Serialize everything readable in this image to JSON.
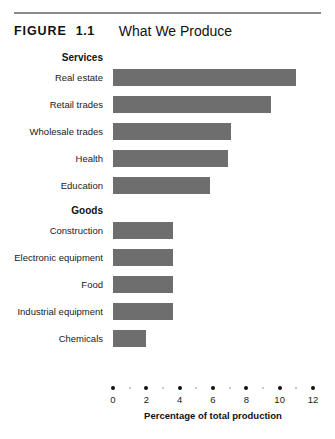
{
  "header": {
    "figure_tag": "FIGURE",
    "figure_number": "1.1",
    "title": "What We Produce"
  },
  "chart_data": {
    "type": "bar",
    "orientation": "horizontal",
    "title": "What We Produce",
    "xlabel": "Percentage of total production",
    "ylabel": "",
    "xlim": [
      0,
      12
    ],
    "grid": false,
    "legend": null,
    "bar_color": "#6e6e6e",
    "xticks": [
      "0",
      "2",
      "4",
      "6",
      "8",
      "10",
      "12"
    ],
    "xtick_values": [
      0,
      2,
      4,
      6,
      8,
      10,
      12
    ],
    "minor_tick_values": [
      1,
      3,
      5,
      7,
      9,
      11
    ],
    "groups": [
      {
        "name": "Services",
        "categories": [
          "Real estate",
          "Retail trades",
          "Wholesale trades",
          "Health",
          "Education"
        ],
        "values": [
          11.0,
          9.5,
          7.1,
          6.9,
          5.8
        ]
      },
      {
        "name": "Goods",
        "categories": [
          "Construction",
          "Electronic equipment",
          "Food",
          "Industrial equipment",
          "Chemicals"
        ],
        "values": [
          3.6,
          3.6,
          3.6,
          3.6,
          2.0
        ]
      }
    ]
  }
}
